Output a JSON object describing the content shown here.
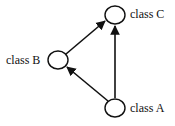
{
  "diagram": {
    "type": "directed-graph",
    "nodes": [
      {
        "id": "A",
        "label": "class A"
      },
      {
        "id": "B",
        "label": "class B"
      },
      {
        "id": "C",
        "label": "class C"
      }
    ],
    "edges": [
      {
        "from": "A",
        "to": "B"
      },
      {
        "from": "B",
        "to": "C"
      },
      {
        "from": "A",
        "to": "C"
      }
    ],
    "colors": {
      "stroke": "#111111",
      "background": "#ffffff"
    }
  }
}
